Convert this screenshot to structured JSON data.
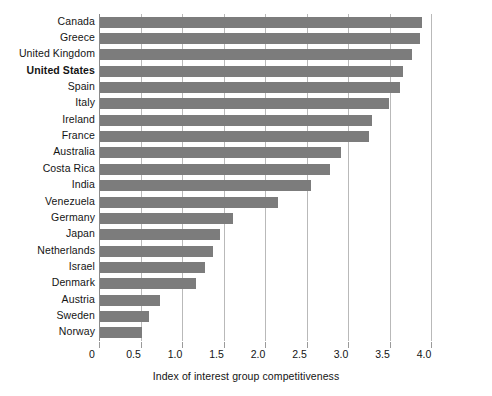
{
  "chart_data": {
    "type": "bar",
    "orientation": "horizontal",
    "title": "",
    "xlabel": "Index of interest group competitiveness",
    "ylabel": "",
    "xlim": [
      0,
      4.0
    ],
    "xticks": [
      "0",
      "0.5",
      "1.0",
      "1.5",
      "2.0",
      "2.5",
      "3.0",
      "3.5",
      "4.0"
    ],
    "xtick_values": [
      0,
      0.5,
      1.0,
      1.5,
      2.0,
      2.5,
      3.0,
      3.5,
      4.0
    ],
    "grid": "vertical",
    "legend": "none",
    "bar_color": "#7c7c7c",
    "highlight": "United States",
    "categories": [
      "Canada",
      "Greece",
      "United Kingdom",
      "United States",
      "Spain",
      "Italy",
      "Ireland",
      "France",
      "Australia",
      "Costa Rica",
      "India",
      "Venezuela",
      "Germany",
      "Japan",
      "Netherlands",
      "Israel",
      "Denmark",
      "Austria",
      "Sweden",
      "Norway"
    ],
    "values": [
      3.88,
      3.85,
      3.76,
      3.65,
      3.62,
      3.48,
      3.28,
      3.24,
      2.9,
      2.77,
      2.54,
      2.14,
      1.6,
      1.45,
      1.36,
      1.27,
      1.16,
      0.72,
      0.59,
      0.51
    ],
    "bold_categories": [
      "United States"
    ]
  }
}
